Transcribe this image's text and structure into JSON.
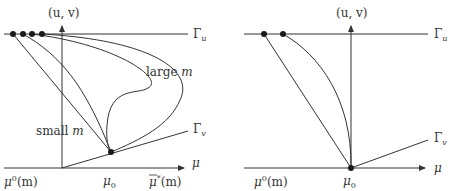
{
  "left_panel": {
    "axis_label_uv": "(u, v)",
    "gamma_u_label": "Γ",
    "gamma_u_sub": "u",
    "gamma_v_label": "Γ",
    "gamma_v_sub": "v",
    "mu_axis_label": "μ",
    "large_m_label": "large m",
    "large_m_text": "large ",
    "large_m_var": "m",
    "small_m_text": "small ",
    "small_m_var": "m",
    "mu0m_base": "μ",
    "mu0m_sup": "0",
    "mu0m_tail": "(m)",
    "mu_sub0_base": "μ",
    "mu_sub0_sub": "0",
    "mubar_base": "μ",
    "mubar_sup": "*",
    "mubar_tail": "(m)"
  },
  "right_panel": {
    "axis_label_uv": "(u, v)",
    "gamma_u_label": "Γ",
    "gamma_u_sub": "u",
    "gamma_v_label": "Γ",
    "gamma_v_sub": "v",
    "mu_axis_label": "μ",
    "mu0m_base": "μ",
    "mu0m_sup": "0",
    "mu0m_tail": "(m)",
    "mu_sub0_base": "μ",
    "mu_sub0_sub": "0"
  },
  "colors": {
    "line": "#333333",
    "dot": "#1a1a1a",
    "background": "#ffffff"
  }
}
